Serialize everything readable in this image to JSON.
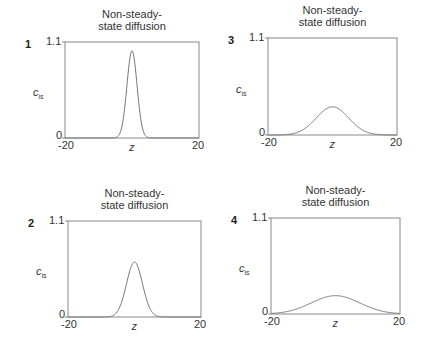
{
  "chart_data": [
    {
      "panel": "1",
      "type": "line",
      "title": "Non-steady-state diffusion",
      "title_lines": [
        "Non-steady-",
        "state diffusion"
      ],
      "xlabel": "z",
      "ylabel": "c",
      "ylabel_sub": "is",
      "xlim": [
        -20,
        20
      ],
      "ylim": [
        0,
        1.1
      ],
      "xticks": [
        "-20",
        "20"
      ],
      "yticks": [
        "0",
        "1.1"
      ],
      "series": [
        {
          "name": "gaussian",
          "center": 0,
          "peak": 1.0,
          "sigma": 1.5
        }
      ],
      "frame": {
        "left": 65,
        "top": 42,
        "right": 199,
        "bottom": 138
      }
    },
    {
      "panel": "3",
      "type": "line",
      "title": "Non-steady-state diffusion",
      "title_lines": [
        "Non-steady-",
        "state diffusion"
      ],
      "xlabel": "z",
      "ylabel": "c",
      "ylabel_sub": "is",
      "xlim": [
        -20,
        20
      ],
      "ylim": [
        0,
        1.1
      ],
      "xticks": [
        "-20",
        "20"
      ],
      "yticks": [
        "0",
        "1.1"
      ],
      "series": [
        {
          "name": "gaussian",
          "center": 0,
          "peak": 0.32,
          "sigma": 5.0
        }
      ],
      "frame": {
        "left": 268,
        "top": 38,
        "right": 397,
        "bottom": 135
      }
    },
    {
      "panel": "2",
      "type": "line",
      "title": "Non-steady-state diffusion",
      "title_lines": [
        "Non-steady-",
        "state diffusion"
      ],
      "xlabel": "z",
      "ylabel": "c",
      "ylabel_sub": "is",
      "xlim": [
        -20,
        20
      ],
      "ylim": [
        0,
        1.1
      ],
      "xticks": [
        "-20",
        "20"
      ],
      "yticks": [
        "0",
        "1.1"
      ],
      "series": [
        {
          "name": "gaussian",
          "center": 0,
          "peak": 0.63,
          "sigma": 2.4
        }
      ],
      "frame": {
        "left": 68,
        "top": 221,
        "right": 201,
        "bottom": 317
      }
    },
    {
      "panel": "4",
      "type": "line",
      "title": "Non-steady-state diffusion",
      "title_lines": [
        "Non-steady-",
        "state diffusion"
      ],
      "xlabel": "z",
      "ylabel": "c",
      "ylabel_sub": "is",
      "xlim": [
        -20,
        20
      ],
      "ylim": [
        0,
        1.1
      ],
      "xticks": [
        "-20",
        "20"
      ],
      "yticks": [
        "0",
        "1.1"
      ],
      "series": [
        {
          "name": "gaussian",
          "center": 0,
          "peak": 0.21,
          "sigma": 7.5
        }
      ],
      "frame": {
        "left": 271,
        "top": 218,
        "right": 400,
        "bottom": 314
      }
    }
  ],
  "style": {
    "frame_color": "#888888",
    "curve_color": "#777777"
  }
}
